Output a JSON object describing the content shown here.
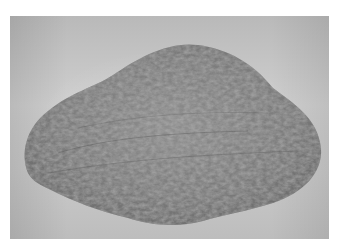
{
  "image": {
    "type": "photograph",
    "subject": "skin-lesion",
    "style": "grayscale",
    "colors": {
      "background_skin": "#c8c8c8",
      "lesion_base": "#7a7a7a",
      "lesion_dark": "#4a4a4a",
      "lesion_light": "#a8a8a8",
      "page_background": "#ffffff"
    }
  }
}
